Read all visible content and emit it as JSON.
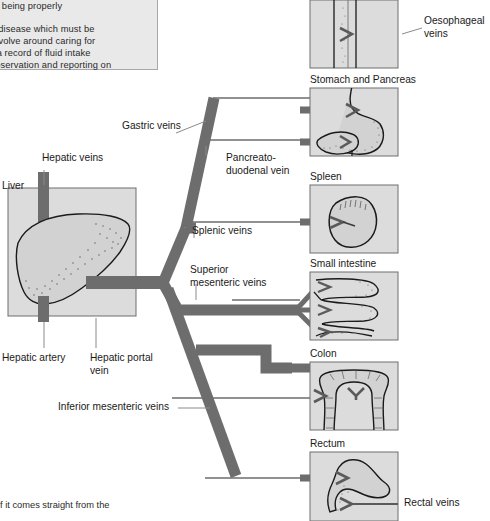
{
  "document": {
    "kind": "anatomy-diagram",
    "subject": "Hepatic portal venous system"
  },
  "colors": {
    "vessel": "#6d6d6d",
    "vessel_dark": "#5a5a5a",
    "panel_fill": "#dcdcdc",
    "panel_border": "#6e6e6e",
    "organ_fill": "#d2d2d2",
    "outline": "#1a1a1a",
    "text": "#1a1a1a",
    "textblock_bg": "#e9e9e9",
    "textblock_border": "#a8a8a8",
    "leader": "#8a8a8a",
    "page_bg": "#ffffff"
  },
  "text_block": {
    "lines": [
      "e not being properly",
      "lying disease which must be",
      "ons revolve around caring for",
      "oing a record of fluid intake",
      "observation and reporting on"
    ]
  },
  "bottom_text": {
    "line": "f it comes straight from the"
  },
  "labels": {
    "hepatic_veins": "Hepatic veins",
    "liver": "Liver",
    "hepatic_artery": "Hepatic artery",
    "hepatic_portal_vein": "Hepatic portal\nvein",
    "hepatic_portal_vein_l1": "Hepatic portal",
    "hepatic_portal_vein_l2": "vein",
    "gastric_veins": "Gastric veins",
    "pancreatoduodenal_l1": "Pancreato-",
    "pancreatoduodenal_l2": "duodenal vein",
    "splenic_veins": "Splenic veins",
    "superior_mesenteric_l1": "Superior",
    "superior_mesenteric_l2": "mesenteric veins",
    "inferior_mesenteric_veins": "Inferior mesenteric veins",
    "oesophageal_veins_l1": "Oesophageal",
    "oesophageal_veins_l2": "veins",
    "rectal_veins": "Rectal veins"
  },
  "panels": [
    {
      "id": "oesophagus",
      "caption": "",
      "x": 310,
      "y": 0,
      "w": 88,
      "h": 68
    },
    {
      "id": "stomach-pancreas",
      "caption": "Stomach and Pancreas",
      "x": 310,
      "y": 88,
      "w": 88,
      "h": 68
    },
    {
      "id": "spleen",
      "caption": "Spleen",
      "x": 310,
      "y": 185,
      "w": 88,
      "h": 68
    },
    {
      "id": "small-intestine",
      "caption": "Small intestine",
      "x": 310,
      "y": 272,
      "w": 88,
      "h": 68
    },
    {
      "id": "colon",
      "caption": "Colon",
      "x": 310,
      "y": 362,
      "w": 88,
      "h": 68
    },
    {
      "id": "rectum",
      "caption": "Rectum",
      "x": 310,
      "y": 452,
      "w": 88,
      "h": 69
    }
  ]
}
